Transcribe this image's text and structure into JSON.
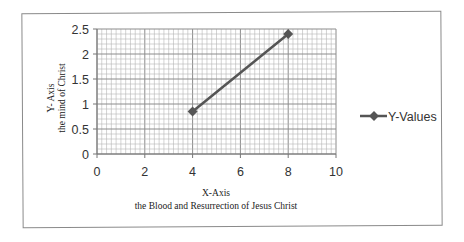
{
  "chart_data": {
    "type": "scatter",
    "subtype": "scatter-with-straight-lines-and-markers",
    "title": "",
    "xlabel": "X-Axis\nthe Blood and Resurrection of Jesus Christ",
    "xlabel_lines": [
      "X-Axis",
      "the Blood and Resurrection of Jesus Christ"
    ],
    "ylabel": "Y- Axis\nthe mind of Christ",
    "ylabel_lines": [
      "Y- Axis",
      "the mind of Christ"
    ],
    "xlim": [
      0,
      10
    ],
    "ylim": [
      0,
      2.5
    ],
    "xticks": [
      "0",
      "2",
      "4",
      "6",
      "8",
      "10"
    ],
    "yticks": [
      "0",
      "0.5",
      "1",
      "1.5",
      "2",
      "2.5"
    ],
    "grid": {
      "major": true,
      "minor": true,
      "x_minor_step": 0.2,
      "y_minor_step": 0.1
    },
    "legend_position": "right",
    "series": [
      {
        "name": "Y-Values",
        "color": "#555555",
        "marker": "diamond",
        "x": [
          4,
          8
        ],
        "y": [
          0.85,
          2.4
        ]
      }
    ]
  },
  "legend": {
    "label": "Y-Values"
  }
}
